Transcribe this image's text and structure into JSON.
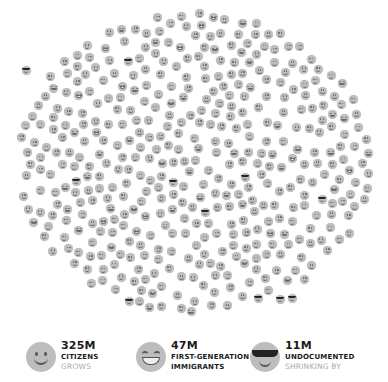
{
  "figure": {
    "face_color": "#bdbdbd",
    "feature_color": "#6a6a6a",
    "sunglasses_color": "#222222",
    "cluster": {
      "center_x": 194,
      "center_y": 163,
      "radius_x": 176,
      "radius_y": 150,
      "count": 430,
      "grin_ratio": 0.12,
      "seed": 7
    },
    "sunglasses_positions": [
      [
        26,
        70
      ],
      [
        128,
        61
      ],
      [
        76,
        181
      ],
      [
        173,
        182
      ],
      [
        245,
        177
      ],
      [
        205,
        212
      ],
      [
        322,
        199
      ],
      [
        129,
        301
      ],
      [
        280,
        299
      ],
      [
        292,
        298
      ],
      [
        258,
        298
      ]
    ]
  },
  "legend": [
    {
      "icon": "smiley-face-icon",
      "count": "325M",
      "label": "CITIZENS",
      "sub": "GROWS"
    },
    {
      "icon": "grinning-face-icon",
      "count": "47M",
      "label": "FIRST-GENERATION",
      "label2": "IMMIGRANTS",
      "sub": ""
    },
    {
      "icon": "sunglasses-face-icon",
      "count": "11M",
      "label": "UNDOCUMENTED",
      "sub": "SHRINKING BY"
    }
  ]
}
